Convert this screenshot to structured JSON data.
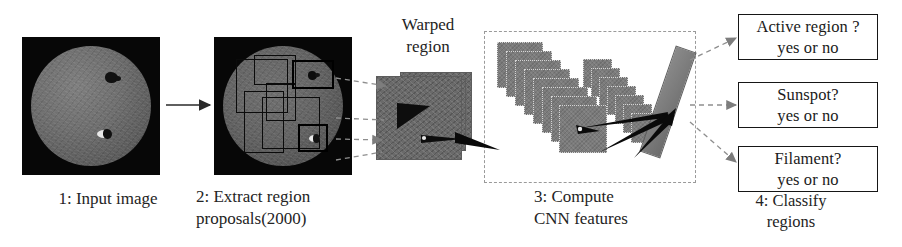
{
  "figure": {
    "type": "pipeline-diagram",
    "title_present": false,
    "background_color": "#ffffff",
    "width": 902,
    "height": 247
  },
  "steps": [
    {
      "id": "step1",
      "caption": "1: Input image",
      "visual": "solar-disk-grayscale-image"
    },
    {
      "id": "step2",
      "caption": "2: Extract region\nproposals(2000)",
      "caption_line1": "2: Extract region",
      "caption_line2": "proposals(2000)",
      "visual": "solar-disk-with-proposal-rectangles",
      "proposal_count": 2000
    },
    {
      "id": "step3",
      "caption": "3: Compute\nCNN features",
      "caption_line1": "3: Compute",
      "caption_line2": "CNN features",
      "visual": "cnn-feature-map-stacks"
    },
    {
      "id": "step4",
      "caption": "4: Classify\nregions",
      "caption_line1": "4: Classify",
      "caption_line2": "regions",
      "visual": "classifier-output-boxes"
    }
  ],
  "warped": {
    "label": "Warped\nregion",
    "label_line1": "Warped",
    "label_line2": "region"
  },
  "classifiers": [
    {
      "question": "Active region ?",
      "answer": "yes or no"
    },
    {
      "question": "Sunspot?",
      "answer": "yes or no"
    },
    {
      "question": "Filament?",
      "answer": "yes or no"
    }
  ],
  "colors": {
    "background": "#ffffff",
    "text": "#242424",
    "box_border": "#161616",
    "dashed_panel_border": "#9a9a9a",
    "connector_dashed": "#8e8e8e",
    "connector_solid": "#2a2a2a",
    "image_backdrop": "#070707",
    "feature_map_fill": "#7b7b7b",
    "warped_fill": "#6a6a6a"
  }
}
